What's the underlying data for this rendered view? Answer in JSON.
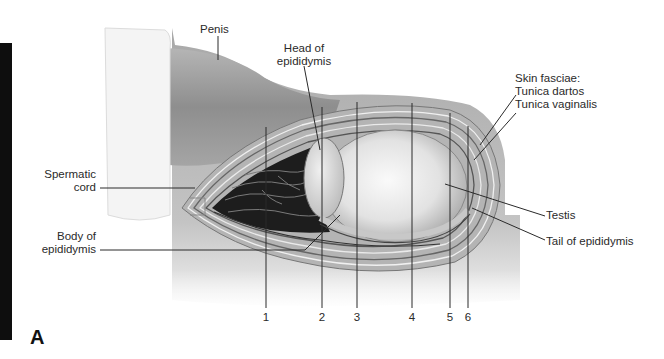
{
  "figure": {
    "panel_label": "A",
    "colors": {
      "line": "#333333",
      "background": "#ffffff",
      "tissue_gray": "#9a9a9a",
      "dark_tissue": "#1a1a1a"
    }
  },
  "labels": {
    "penis": "Penis",
    "head_epididymis_1": "Head of",
    "head_epididymis_2": "epididymis",
    "spermatic_1": "Spermatic",
    "spermatic_2": "cord",
    "body_epididymis_1": "Body of",
    "body_epididymis_2": "epididymis",
    "skin_fasciae": "Skin fasciae:",
    "tunica_dartos": "Tunica dartos",
    "tunica_vaginalis": "Tunica vaginalis",
    "testis": "Testis",
    "tail_epididymis": "Tail of epididymis"
  },
  "layer_numbers": [
    "1",
    "2",
    "3",
    "4",
    "5",
    "6"
  ]
}
